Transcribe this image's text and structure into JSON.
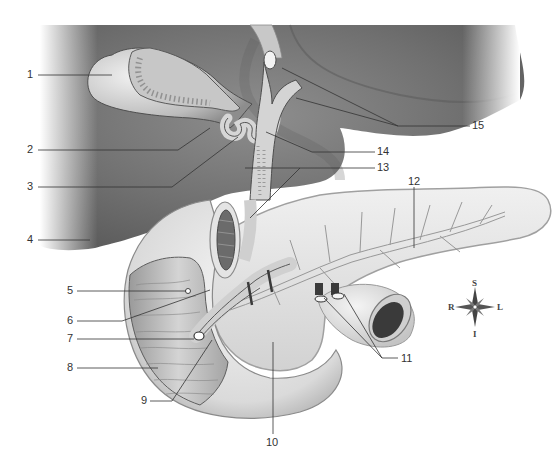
{
  "figure": {
    "type": "anatomical-illustration",
    "colors": {
      "background": "#ffffff",
      "liver_dark": "#6f6f6f",
      "liver_mid": "#8c8c8c",
      "organ_light": "#e6e6e6",
      "organ_mid": "#cfcfcf",
      "duct_fill": "#d8d8d8",
      "leader_line": "#333333",
      "label_text": "#333333"
    }
  },
  "labels": [
    {
      "id": "1",
      "text": "1",
      "x": 28,
      "y": 70
    },
    {
      "id": "2",
      "text": "2",
      "x": 28,
      "y": 145
    },
    {
      "id": "3",
      "text": "3",
      "x": 28,
      "y": 182
    },
    {
      "id": "4",
      "text": "4",
      "x": 28,
      "y": 235
    },
    {
      "id": "5",
      "text": "5",
      "x": 66,
      "y": 287
    },
    {
      "id": "6",
      "text": "6",
      "x": 66,
      "y": 316
    },
    {
      "id": "7",
      "text": "7",
      "x": 66,
      "y": 334
    },
    {
      "id": "8",
      "text": "8",
      "x": 66,
      "y": 363
    },
    {
      "id": "9",
      "text": "9",
      "x": 141,
      "y": 396
    },
    {
      "id": "10",
      "text": "10",
      "x": 266,
      "y": 436
    },
    {
      "id": "11",
      "text": "11",
      "x": 401,
      "y": 355
    },
    {
      "id": "12",
      "text": "12",
      "x": 409,
      "y": 177
    },
    {
      "id": "13",
      "text": "13",
      "x": 377,
      "y": 162
    },
    {
      "id": "14",
      "text": "14",
      "x": 377,
      "y": 146
    },
    {
      "id": "15",
      "text": "15",
      "x": 472,
      "y": 121
    }
  ],
  "compass": {
    "superior": "S",
    "inferior": "I",
    "right": "R",
    "left": "L",
    "center_x": 475,
    "center_y": 307
  }
}
